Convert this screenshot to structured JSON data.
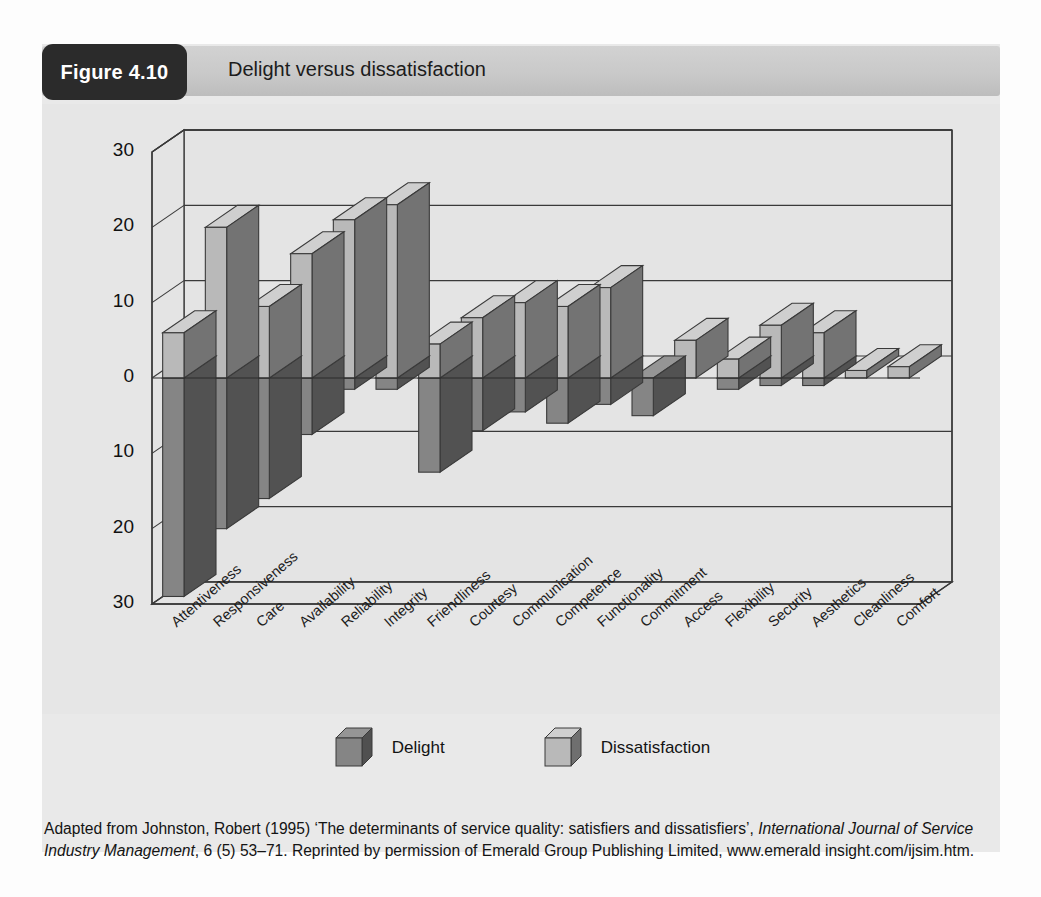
{
  "figure": {
    "badge": "Figure 4.10",
    "title": "Delight versus dissatisfaction"
  },
  "legend": {
    "items": [
      {
        "label": "Delight",
        "color": "#858585"
      },
      {
        "label": "Dissatisfaction",
        "color": "#b9b9b9"
      }
    ]
  },
  "caption": {
    "line1_a": "Adapted from Johnston, Robert (1995) ‘The determinants of service quality: satisfiers and dissatisfiers’,",
    "line2_italic": "International Journal of Service Industry Management",
    "line2_b": ", 6 (5) 53–71. Reprinted by permission of Emerald Group",
    "line3": "Publishing Limited, www.emerald insight.com/ijsim.htm."
  },
  "chart_data": {
    "type": "bar",
    "title": "Delight versus dissatisfaction",
    "xlabel": "",
    "ylabel": "",
    "ylim": [
      -30,
      30
    ],
    "yticks": [
      30,
      20,
      10,
      0,
      10,
      20,
      30
    ],
    "ytick_values": [
      30,
      20,
      10,
      0,
      -10,
      -20,
      -30
    ],
    "grid": true,
    "legend_position": "bottom",
    "note": "Positive (upward, light grey) = Dissatisfaction; negative (downward, dark grey) = Delight. Axis tick labels are shown unsigned.",
    "categories": [
      "Attentiveness",
      "Responsiveness",
      "Care",
      "Availability",
      "Reliability",
      "Integrity",
      "Friendliness",
      "Courtesy",
      "Communication",
      "Competence",
      "Functionality",
      "Commitment",
      "Access",
      "Flexibility",
      "Security",
      "Aesthetics",
      "Cleanliness",
      "Comfort"
    ],
    "series": [
      {
        "name": "Dissatisfaction",
        "color": "#b9b9b9",
        "values": [
          6,
          20,
          9.5,
          16.5,
          21,
          23,
          4.5,
          8,
          10,
          9.5,
          12,
          0,
          5,
          2.5,
          7,
          6,
          1,
          1.5
        ]
      },
      {
        "name": "Delight",
        "color": "#858585",
        "values": [
          -29,
          -20,
          -16,
          -7.5,
          -1.5,
          -1.5,
          -12.5,
          -7,
          -4.5,
          -6,
          -3.5,
          -5,
          0,
          -1.5,
          -1,
          -1,
          0,
          0
        ]
      }
    ]
  }
}
